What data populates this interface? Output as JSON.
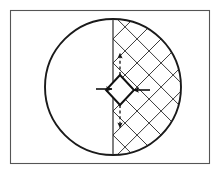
{
  "figure": {
    "canvas": {
      "width": 223,
      "height": 177,
      "background": "#ffffff"
    },
    "frame": {
      "name": "figure-border",
      "x": 10.5,
      "y": 10.5,
      "width": 199,
      "height": 153,
      "stroke": "#555555",
      "stroke_width": 1.1,
      "fill": "#ffffff"
    },
    "circle": {
      "name": "outer-circle",
      "cx": 113,
      "cy": 87,
      "r": 68,
      "stroke": "#1a1a1a",
      "stroke_width": 1.9,
      "fill": "none"
    },
    "diameter_line": {
      "name": "vertical-diameter",
      "x": 113,
      "y_top": 19,
      "y_bottom": 155,
      "stroke": "#2b2b2b",
      "stroke_width": 1.2
    },
    "hatching": {
      "name": "cross-hatch-right-half",
      "region": "right half of circle",
      "angles_deg": [
        45,
        -45
      ],
      "spacing": 17,
      "stroke": "#3a3a3a",
      "stroke_width": 1.0
    },
    "diamond": {
      "name": "center-diamond",
      "cx": 120,
      "cy": 90,
      "half_diagonal_x": 14,
      "half_diagonal_y": 15,
      "stroke": "#111111",
      "stroke_width": 2.0,
      "fill": "none"
    },
    "arrows": [
      {
        "name": "arrow-left-inward",
        "style": "solid",
        "direction": "right",
        "x1": 96,
        "y1": 89,
        "x2": 112,
        "y2": 89,
        "stroke": "#111111",
        "stroke_width": 1.6
      },
      {
        "name": "arrow-right-inward",
        "style": "solid",
        "direction": "left",
        "x1": 150,
        "y1": 90,
        "x2": 133,
        "y2": 90,
        "stroke": "#111111",
        "stroke_width": 1.6
      },
      {
        "name": "arrow-up-dashed",
        "style": "dashed",
        "direction": "up",
        "x1": 120,
        "y1": 75,
        "x2": 120,
        "y2": 53,
        "stroke": "#111111",
        "stroke_width": 1.3
      },
      {
        "name": "arrow-down-dashed",
        "style": "dashed",
        "direction": "down",
        "x1": 120,
        "y1": 105,
        "x2": 120,
        "y2": 128,
        "stroke": "#111111",
        "stroke_width": 1.3
      }
    ]
  }
}
